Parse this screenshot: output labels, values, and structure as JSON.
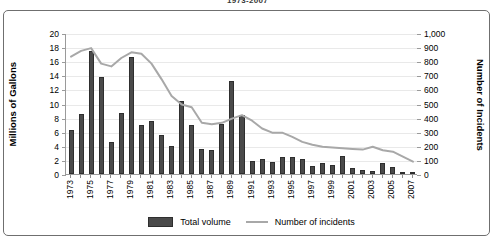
{
  "chart_data": {
    "type": "bar",
    "title": "1973-2007",
    "xlabel": "",
    "ylabel": "Millions of Gallons",
    "y2label": "Number of Incidents",
    "ylim": [
      0,
      20
    ],
    "y2lim": [
      0,
      1000
    ],
    "grid": true,
    "legend_position": "bottom",
    "categories": [
      "1973",
      "1974",
      "1975",
      "1976",
      "1977",
      "1978",
      "1979",
      "1980",
      "1981",
      "1982",
      "1983",
      "1984",
      "1985",
      "1986",
      "1987",
      "1988",
      "1989",
      "1990",
      "1991",
      "1992",
      "1993",
      "1994",
      "1995",
      "1996",
      "1997",
      "1998",
      "1999",
      "2000",
      "2001",
      "2002",
      "2003",
      "2004",
      "2005",
      "2006",
      "2007"
    ],
    "x_tick_labels": [
      "1973",
      "1975",
      "1977",
      "1979",
      "1981",
      "1983",
      "1985",
      "1987",
      "1989",
      "1991",
      "1993",
      "1995",
      "1997",
      "1999",
      "2001",
      "2003",
      "2005",
      "2007"
    ],
    "y_tick_labels": [
      "20",
      "18",
      "16",
      "14",
      "12",
      "10",
      "8",
      "6",
      "4",
      "2",
      "0"
    ],
    "y2_tick_labels": [
      "1,000",
      "900",
      "800",
      "700",
      "600",
      "500",
      "400",
      "300",
      "200",
      "100",
      "0"
    ],
    "series": [
      {
        "name": "Total volume",
        "type": "bar",
        "axis": "left",
        "color": "#4a4a4a",
        "values": [
          6.3,
          8.5,
          17.4,
          13.8,
          4.5,
          8.6,
          16.6,
          7.0,
          7.5,
          5.6,
          4.0,
          10.3,
          6.9,
          3.6,
          3.4,
          7.1,
          13.2,
          8.4,
          1.9,
          2.1,
          1.7,
          2.4,
          2.4,
          2.1,
          1.2,
          1.5,
          1.3,
          2.6,
          0.9,
          0.5,
          0.4,
          1.5,
          1.0,
          0.3,
          0.3
        ]
      },
      {
        "name": "Number of incidents",
        "type": "line",
        "axis": "right",
        "color": "#a8a8a8",
        "values": [
          840,
          880,
          900,
          790,
          770,
          830,
          870,
          860,
          790,
          680,
          560,
          500,
          480,
          370,
          360,
          370,
          400,
          425,
          385,
          330,
          300,
          300,
          270,
          235,
          215,
          200,
          195,
          190,
          185,
          180,
          200,
          175,
          165,
          130,
          95
        ]
      }
    ]
  },
  "legend": {
    "items": [
      {
        "label": "Total volume",
        "marker": "bar-swatch"
      },
      {
        "label": "Number of incidents",
        "marker": "line-swatch"
      }
    ]
  }
}
